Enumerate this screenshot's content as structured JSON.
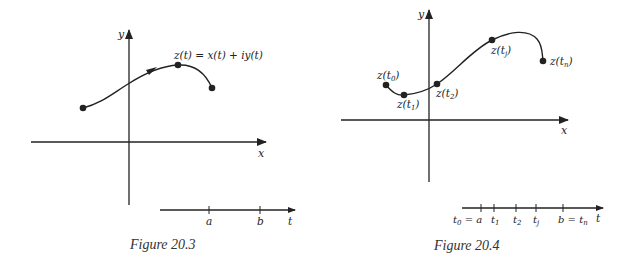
{
  "figures": [
    {
      "id": "fig-20-3",
      "caption": "Figure 20.3",
      "axes": {
        "x_label": "x",
        "y_label": "y"
      },
      "curve_label": "z(t) = x(t) + iy(t)",
      "t_axis": {
        "label": "t",
        "ticks": [
          "a",
          "b"
        ]
      }
    },
    {
      "id": "fig-20-4",
      "caption": "Figure 20.4",
      "axes": {
        "x_label": "x",
        "y_label": "y"
      },
      "points": [
        {
          "z": "z(",
          "t": "t",
          "sub": "0",
          "close": ")"
        },
        {
          "z": "z(",
          "t": "t",
          "sub": "1",
          "close": ")"
        },
        {
          "z": "z(",
          "t": "t",
          "sub": "2",
          "close": ")"
        },
        {
          "z": "z(",
          "t": "t",
          "sub": "j",
          "close": ")"
        },
        {
          "z": "z(",
          "t": "t",
          "sub": "n",
          "close": ")"
        }
      ],
      "t_axis": {
        "label": "t",
        "ticks": [
          {
            "main": "t",
            "sub": "0",
            "suffix": " = a"
          },
          {
            "main": "t",
            "sub": "1",
            "suffix": ""
          },
          {
            "main": "t",
            "sub": "2",
            "suffix": ""
          },
          {
            "main": "t",
            "sub": "j",
            "suffix": ""
          },
          {
            "main": "b = t",
            "sub": "n",
            "suffix": ""
          }
        ]
      }
    }
  ],
  "colors": {
    "ink": "#222222",
    "background": "#ffffff"
  }
}
